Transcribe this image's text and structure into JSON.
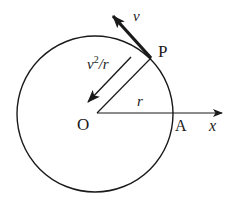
{
  "diagram": {
    "type": "circular-motion",
    "labels": {
      "velocity": "v",
      "accel_base": "v",
      "accel_exp": "2",
      "accel_rest": "/r",
      "point_p": "P",
      "center": "O",
      "radius": "r",
      "point_a": "A",
      "axis": "x"
    },
    "colors": {
      "stroke": "#1a1a1a",
      "background": "#ffffff"
    }
  }
}
